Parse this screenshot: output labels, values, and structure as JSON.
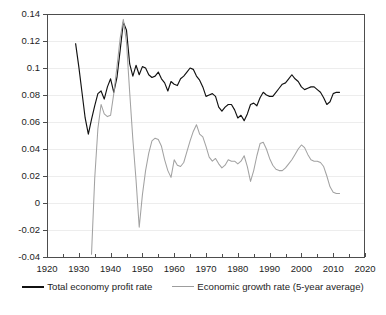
{
  "chart_data": {
    "type": "line",
    "title": "",
    "xlabel": "",
    "ylabel": "",
    "xlim": [
      1920,
      2020
    ],
    "ylim": [
      -0.04,
      0.14
    ],
    "grid": true,
    "legend_position": "bottom-center",
    "x_ticks": [
      1920,
      1930,
      1940,
      1950,
      1960,
      1970,
      1980,
      1990,
      2000,
      2010,
      2020
    ],
    "x_minor_ticks": [
      1925,
      1935,
      1945,
      1955,
      1965,
      1975,
      1985,
      1995,
      2005,
      2015
    ],
    "y_ticks": [
      -0.04,
      -0.02,
      0,
      0.02,
      0.04,
      0.06,
      0.08,
      0.1,
      0.12,
      0.14
    ],
    "y_tick_labels": [
      "-0.04",
      "-0.02",
      "0",
      "0.02",
      "0.04",
      "0.06",
      "0.08",
      "0.1",
      "0.12",
      "0.14"
    ],
    "colors": {
      "profit": "#111111",
      "growth": "#a2a2a2",
      "grid": "#ededed",
      "axis": "#4d4d4d"
    },
    "series": [
      {
        "name": "Total economy profit rate",
        "color": "#111111",
        "x": [
          1929,
          1930,
          1931,
          1932,
          1933,
          1934,
          1935,
          1936,
          1937,
          1938,
          1939,
          1940,
          1941,
          1942,
          1943,
          1944,
          1945,
          1946,
          1947,
          1948,
          1949,
          1950,
          1951,
          1952,
          1953,
          1954,
          1955,
          1956,
          1957,
          1958,
          1959,
          1960,
          1961,
          1962,
          1963,
          1964,
          1965,
          1966,
          1967,
          1968,
          1969,
          1970,
          1971,
          1972,
          1973,
          1974,
          1975,
          1976,
          1977,
          1978,
          1979,
          1980,
          1981,
          1982,
          1983,
          1984,
          1985,
          1986,
          1987,
          1988,
          1989,
          1990,
          1991,
          1992,
          1993,
          1994,
          1995,
          1996,
          1997,
          1998,
          1999,
          2000,
          2001,
          2002,
          2003,
          2004,
          2005,
          2006,
          2007,
          2008,
          2009,
          2010,
          2011,
          2012
        ],
        "y": [
          0.118,
          0.101,
          0.082,
          0.063,
          0.051,
          0.062,
          0.072,
          0.081,
          0.083,
          0.077,
          0.086,
          0.092,
          0.082,
          0.093,
          0.113,
          0.134,
          0.128,
          0.103,
          0.094,
          0.102,
          0.095,
          0.101,
          0.1,
          0.095,
          0.093,
          0.094,
          0.097,
          0.092,
          0.089,
          0.083,
          0.09,
          0.088,
          0.087,
          0.092,
          0.094,
          0.097,
          0.1,
          0.099,
          0.094,
          0.091,
          0.086,
          0.079,
          0.08,
          0.081,
          0.079,
          0.071,
          0.068,
          0.071,
          0.073,
          0.073,
          0.069,
          0.063,
          0.065,
          0.061,
          0.066,
          0.073,
          0.074,
          0.072,
          0.078,
          0.082,
          0.08,
          0.079,
          0.079,
          0.082,
          0.085,
          0.088,
          0.089,
          0.092,
          0.095,
          0.092,
          0.09,
          0.086,
          0.084,
          0.085,
          0.086,
          0.086,
          0.084,
          0.082,
          0.078,
          0.073,
          0.075,
          0.081,
          0.082,
          0.082
        ]
      },
      {
        "name": "Economic growth rate (5-year average)",
        "color": "#a2a2a2",
        "x": [
          1934,
          1935,
          1936,
          1937,
          1938,
          1939,
          1940,
          1941,
          1942,
          1943,
          1944,
          1945,
          1946,
          1947,
          1948,
          1949,
          1950,
          1951,
          1952,
          1953,
          1954,
          1955,
          1956,
          1957,
          1958,
          1959,
          1960,
          1961,
          1962,
          1963,
          1964,
          1965,
          1966,
          1967,
          1968,
          1969,
          1970,
          1971,
          1972,
          1973,
          1974,
          1975,
          1976,
          1977,
          1978,
          1979,
          1980,
          1981,
          1982,
          1983,
          1984,
          1985,
          1986,
          1987,
          1988,
          1989,
          1990,
          1991,
          1992,
          1993,
          1994,
          1995,
          1996,
          1997,
          1998,
          1999,
          2000,
          2001,
          2002,
          2003,
          2004,
          2005,
          2006,
          2007,
          2008,
          2009,
          2010,
          2011,
          2012
        ],
        "y": [
          -0.038,
          0.018,
          0.055,
          0.073,
          0.066,
          0.064,
          0.065,
          0.081,
          0.101,
          0.122,
          0.136,
          0.119,
          0.082,
          0.047,
          0.017,
          -0.018,
          0.006,
          0.024,
          0.037,
          0.046,
          0.048,
          0.047,
          0.042,
          0.032,
          0.024,
          0.019,
          0.032,
          0.028,
          0.027,
          0.03,
          0.038,
          0.046,
          0.053,
          0.058,
          0.051,
          0.049,
          0.042,
          0.034,
          0.031,
          0.033,
          0.029,
          0.026,
          0.028,
          0.032,
          0.031,
          0.031,
          0.029,
          0.031,
          0.035,
          0.027,
          0.016,
          0.024,
          0.035,
          0.044,
          0.045,
          0.04,
          0.033,
          0.028,
          0.025,
          0.024,
          0.024,
          0.026,
          0.029,
          0.032,
          0.036,
          0.04,
          0.043,
          0.041,
          0.036,
          0.032,
          0.031,
          0.031,
          0.03,
          0.027,
          0.02,
          0.012,
          0.008,
          0.007,
          0.007
        ]
      }
    ]
  },
  "legend": {
    "entries": [
      {
        "label": "Total economy profit rate",
        "style": "profit"
      },
      {
        "label": "Economic growth rate (5-year average)",
        "style": "growth"
      }
    ]
  }
}
